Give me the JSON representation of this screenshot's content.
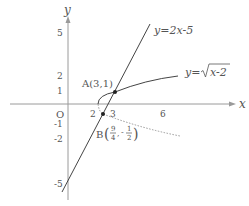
{
  "diagram": {
    "type": "coordinate-graph",
    "colors": {
      "axis": "#9a9a9a",
      "curve": "#444444",
      "dashed": "#999999",
      "text": "#555555"
    },
    "axes": {
      "x_label": "x",
      "y_label": "y",
      "origin_label": "O",
      "x_ticks": [
        "2",
        "3",
        "6"
      ],
      "y_ticks": [
        "5",
        "2",
        "1",
        "-1",
        "-2",
        "-5"
      ]
    },
    "curves": [
      {
        "name": "line",
        "equation_label": "y=2x-5"
      },
      {
        "name": "sqrt-curve",
        "equation_label_prefix": "y=",
        "radicand": "x-2"
      },
      {
        "name": "lower-branch-dashed",
        "style": "dashed"
      }
    ],
    "points": {
      "A": {
        "label": "A(3,1)",
        "x": 3,
        "y": 1
      },
      "B": {
        "prefix": "B",
        "x_num": "9",
        "x_den": "4",
        "y_sign": "-",
        "y_num": "1",
        "y_den": "2",
        "x": 2.25,
        "y": -0.5
      }
    }
  }
}
